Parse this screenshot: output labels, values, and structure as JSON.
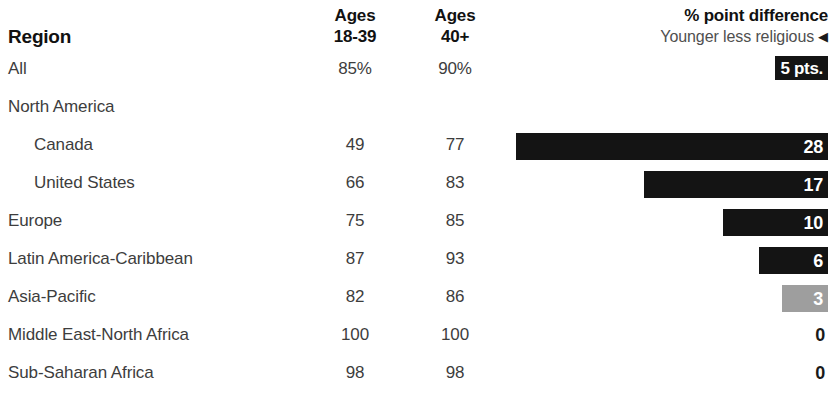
{
  "header": {
    "region_label": "Region",
    "col_young": {
      "line1": "Ages",
      "line2": "18-39"
    },
    "col_old": {
      "line1": "Ages",
      "line2": "40+"
    },
    "diff_title": "% point difference",
    "diff_subtitle": "Younger less religious",
    "diff_arrow_icon": "left-triangle-arrow",
    "colors": {
      "bar_significant": "#141414",
      "bar_not_significant": "#9e9e9e",
      "text": "#3d3d3d",
      "heading": "#111111"
    }
  },
  "chart_data": {
    "type": "bar",
    "title": "% point difference",
    "subtitle": "Younger less religious",
    "xlabel": "",
    "ylabel": "Region",
    "columns": [
      "Region",
      "Ages 18-39",
      "Ages 40+",
      "% point difference"
    ],
    "categories": [
      "All",
      "North America",
      "Canada",
      "United States",
      "Europe",
      "Latin America-Caribbean",
      "Asia-Pacific",
      "Middle East-North Africa",
      "Sub-Saharan Africa"
    ],
    "series": [
      {
        "name": "Ages 18-39",
        "values": [
          "85%",
          null,
          "49",
          "66",
          "75",
          "87",
          "82",
          "100",
          "98"
        ]
      },
      {
        "name": "Ages 40+",
        "values": [
          "90%",
          null,
          "77",
          "83",
          "85",
          "93",
          "86",
          "100",
          "98"
        ]
      },
      {
        "name": "% point difference",
        "values": [
          5,
          null,
          28,
          17,
          10,
          6,
          3,
          0,
          0
        ]
      }
    ],
    "bar_max": 28,
    "grid": false,
    "legend": "none"
  },
  "rows": [
    {
      "label": "All",
      "indent": false,
      "young": "85%",
      "old": "90%",
      "diff": 5,
      "diff_label": "5 pts.",
      "has_bar": true,
      "bar_width_px": 53,
      "significant": true
    },
    {
      "label": "North America",
      "indent": false,
      "young": "",
      "old": "",
      "diff": null,
      "diff_label": "",
      "has_bar": false,
      "bar_width_px": 0,
      "significant": false
    },
    {
      "label": "Canada",
      "indent": true,
      "young": "49",
      "old": "77",
      "diff": 28,
      "diff_label": "28",
      "has_bar": true,
      "bar_width_px": 312,
      "significant": true
    },
    {
      "label": "United States",
      "indent": true,
      "young": "66",
      "old": "83",
      "diff": 17,
      "diff_label": "17",
      "has_bar": true,
      "bar_width_px": 184,
      "significant": true
    },
    {
      "label": "Europe",
      "indent": false,
      "young": "75",
      "old": "85",
      "diff": 10,
      "diff_label": "10",
      "has_bar": true,
      "bar_width_px": 105,
      "significant": true
    },
    {
      "label": "Latin America-Caribbean",
      "indent": false,
      "young": "87",
      "old": "93",
      "diff": 6,
      "diff_label": "6",
      "has_bar": true,
      "bar_width_px": 69,
      "significant": true
    },
    {
      "label": "Asia-Pacific",
      "indent": false,
      "young": "82",
      "old": "86",
      "diff": 3,
      "diff_label": "3",
      "has_bar": true,
      "bar_width_px": 46,
      "significant": false
    },
    {
      "label": "Middle East-North Africa",
      "indent": false,
      "young": "100",
      "old": "100",
      "diff": 0,
      "diff_label": "0",
      "has_bar": false,
      "bar_width_px": 0,
      "significant": false
    },
    {
      "label": "Sub-Saharan Africa",
      "indent": false,
      "young": "98",
      "old": "98",
      "diff": 0,
      "diff_label": "0",
      "has_bar": false,
      "bar_width_px": 0,
      "significant": false
    }
  ]
}
